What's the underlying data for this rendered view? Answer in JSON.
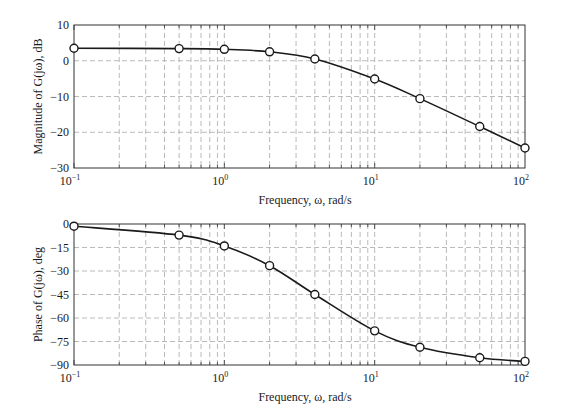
{
  "chart_data": [
    {
      "type": "line",
      "title": "",
      "xlabel": "Frequency, ω, rad/s",
      "ylabel": "Magnitude of G(jω), dB",
      "xscale": "log",
      "xlim": [
        0.1,
        100
      ],
      "ylim": [
        -30,
        10
      ],
      "xticks": [
        "10^-1",
        "10^0",
        "10^1",
        "10^2"
      ],
      "yticks": [
        10,
        0,
        -10,
        -20,
        -30
      ],
      "grid": true,
      "series": [
        {
          "name": "Magnitude",
          "x": [
            0.1,
            0.5,
            1,
            2,
            4,
            10,
            20,
            50,
            100
          ],
          "values": [
            3.5,
            3.4,
            3.2,
            2.5,
            0.5,
            -5.1,
            -10.6,
            -18.4,
            -24.4
          ]
        }
      ]
    },
    {
      "type": "line",
      "title": "",
      "xlabel": "Frequency, ω, rad/s",
      "ylabel": "Phase of G(jω), deg",
      "xscale": "log",
      "xlim": [
        0.1,
        100
      ],
      "ylim": [
        -90,
        0
      ],
      "xticks": [
        "10^-1",
        "10^0",
        "10^1",
        "10^2"
      ],
      "yticks": [
        0,
        -15,
        -30,
        -45,
        -60,
        -75,
        -90
      ],
      "grid": true,
      "series": [
        {
          "name": "Phase",
          "x": [
            0.1,
            0.5,
            1,
            2,
            4,
            10,
            20,
            50,
            100
          ],
          "values": [
            -1.4,
            -7.1,
            -14.0,
            -26.6,
            -45.0,
            -68.2,
            -78.7,
            -85.4,
            -87.7
          ]
        }
      ]
    }
  ],
  "labels": {
    "top_ylabel": "Magnitude of G(jω), dB",
    "bottom_ylabel": "Phase of G(jω), deg",
    "xlabel": "Frequency, ω, rad/s"
  }
}
